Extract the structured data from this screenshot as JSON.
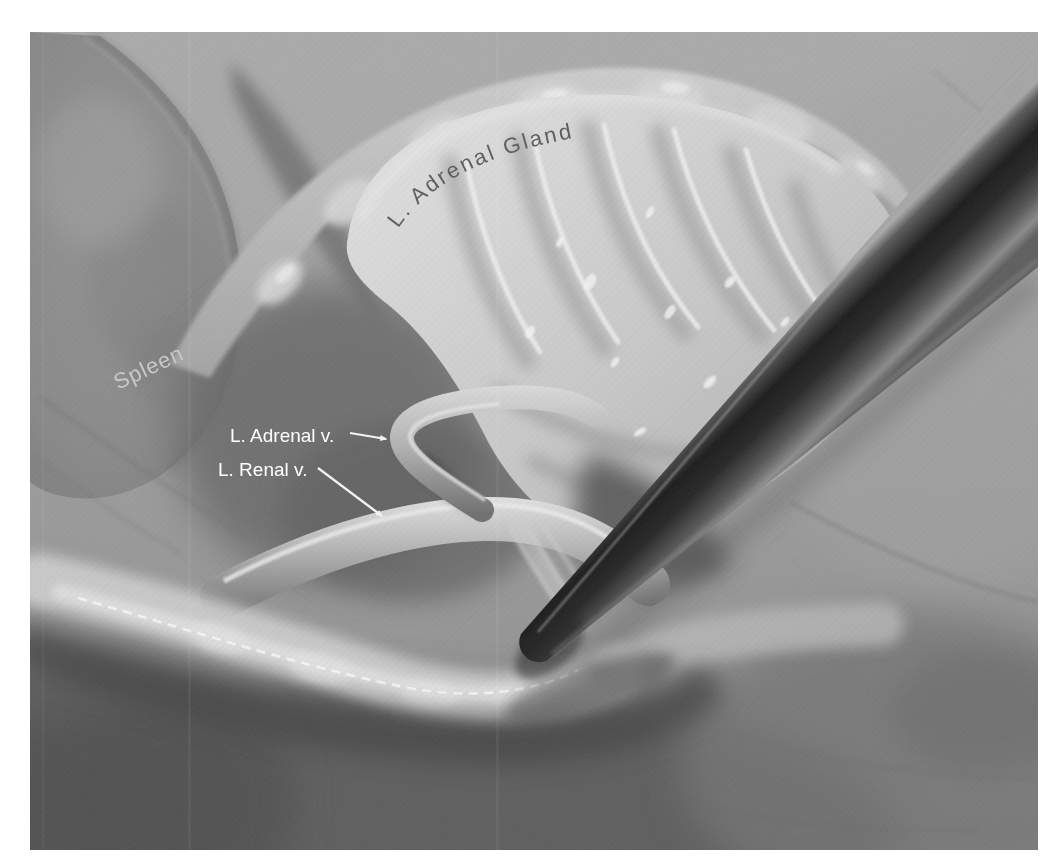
{
  "figure": {
    "labels": {
      "adrenal_gland": "L. Adrenal Gland",
      "spleen": "Spleen",
      "adrenal_vein": "L. Adrenal v.",
      "renal_vein": "L. Renal v."
    },
    "label_colors": {
      "adrenal_gland": "#5f5f5f",
      "spleen": "#c8c8c8",
      "adrenal_vein": "#ffffff",
      "renal_vein": "#ffffff"
    },
    "leader_line_color": "#f2f2f2",
    "page_background": "#ffffff",
    "tissue_base_color": "#9d9d9d",
    "instrument_color": "#1e1e1e"
  }
}
